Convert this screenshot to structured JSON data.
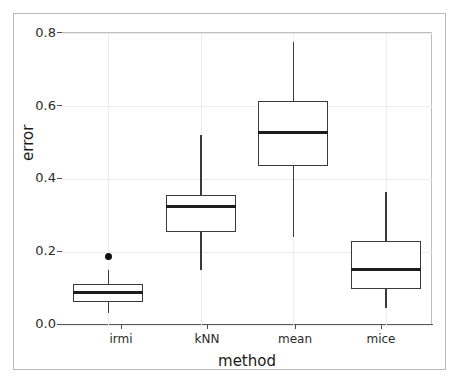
{
  "chart_data": {
    "type": "box",
    "title": "",
    "xlabel": "method",
    "ylabel": "error",
    "categories": [
      "irmi",
      "kNN",
      "mean",
      "mice"
    ],
    "ylim": [
      0.0,
      0.8
    ],
    "yticks": [
      0.0,
      0.2,
      0.4,
      0.6,
      0.8
    ],
    "ytick_labels": [
      "0.0",
      "0.2",
      "0.4",
      "0.6",
      "0.8"
    ],
    "grid": "light gray major gridlines, horizontal and vertical",
    "legend": "none",
    "boxes": [
      {
        "category": "irmi",
        "whisker_low": 0.034,
        "q1": 0.063,
        "median": 0.088,
        "q3": 0.113,
        "whisker_high": 0.151,
        "outliers": [
          0.187
        ]
      },
      {
        "category": "kNN",
        "whisker_low": 0.15,
        "q1": 0.255,
        "median": 0.325,
        "q3": 0.355,
        "whisker_high": 0.52,
        "outliers": []
      },
      {
        "category": "mean",
        "whisker_low": 0.24,
        "q1": 0.435,
        "median": 0.528,
        "q3": 0.613,
        "whisker_high": 0.775,
        "outliers": []
      },
      {
        "category": "mice",
        "whisker_low": 0.047,
        "q1": 0.099,
        "median": 0.153,
        "q3": 0.23,
        "whisker_high": 0.365,
        "outliers": []
      }
    ],
    "colors": {
      "box_stroke": "#3a3a3a",
      "median_stroke": "#1c1c1c",
      "outlier_fill": "#111111",
      "grid": "#ececec",
      "axis": "#595959",
      "frame": "#b8b8b8",
      "background": "#ffffff"
    }
  }
}
